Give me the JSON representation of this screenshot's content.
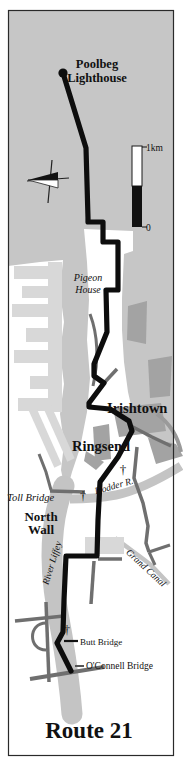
{
  "map": {
    "title": "Route 21",
    "labels": {
      "poolbeg_line1": "Poolbeg",
      "poolbeg_line2": "Lighthouse",
      "pigeon_line1": "Pigeon",
      "pigeon_line2": "House",
      "irishtown": "Irishtown",
      "ringsend": "Ringsend",
      "toll_bridge": "Toll Bridge",
      "north_wall_line1": "North",
      "north_wall_line2": "Wall",
      "dodder_river": "Dodder R.",
      "river_liffey": "River Liffey",
      "grand_canal": "Grand Canal",
      "butt_bridge": "Butt Bridge",
      "oconnell_bridge": "O'Connell Bridge"
    },
    "scale_bar": {
      "top_label": "1km",
      "bottom_label": "0"
    },
    "symbols": {
      "church": "†"
    },
    "colors": {
      "sea": "#c6c6c6",
      "land": "#ffffff",
      "pier": "#d8d8d8",
      "built_up": "#a3a3a3",
      "road": "#6f6f6f",
      "river": "#c4c4c4",
      "route": "#0d0d0d"
    }
  }
}
